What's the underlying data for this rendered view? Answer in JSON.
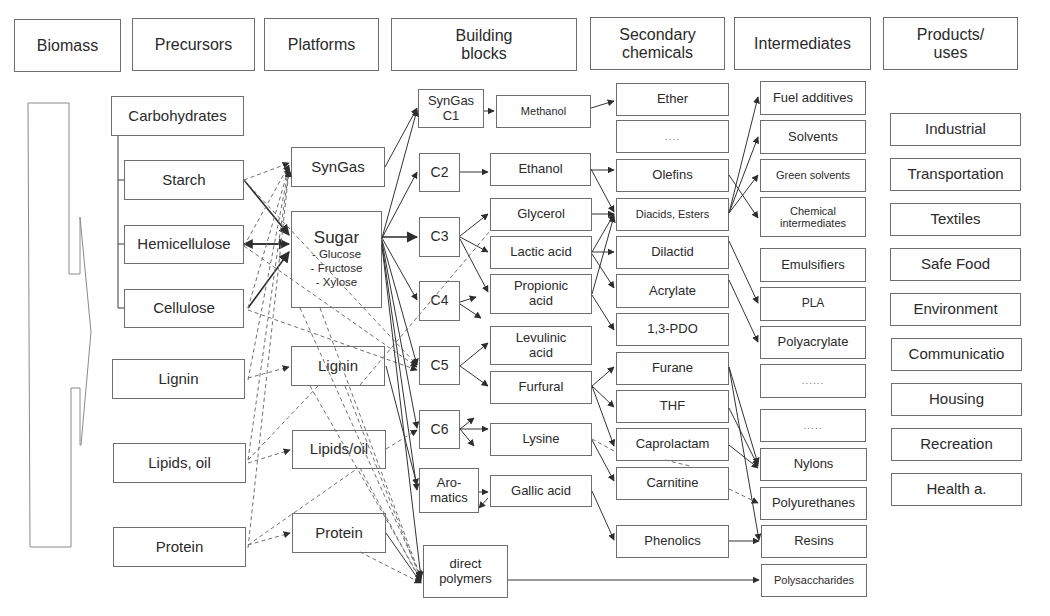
{
  "headers": {
    "biomass": "Biomass",
    "precursors": "Precursors",
    "platforms": "Platforms",
    "building_blocks": "Building\nblocks",
    "secondary_chemicals": "Secondary\nchemicals",
    "intermediates": "Intermediates",
    "products_uses": "Products/\nuses"
  },
  "precursors": {
    "carbohydrates": "Carbohydrates",
    "starch": "Starch",
    "hemicellulose": "Hemicellulose",
    "cellulose": "Cellulose",
    "lignin": "Lignin",
    "lipids_oil": "Lipids, oil",
    "protein": "Protein"
  },
  "platforms": {
    "syngas": "SynGas",
    "sugar": {
      "title": "Sugar",
      "items": [
        "- Glucose",
        "- Fructose",
        "- Xylose"
      ]
    },
    "lignin": "Lignin",
    "lipids_oil": "Lipids/oil",
    "protein": "Protein"
  },
  "building_blocks": {
    "syngas_c1": "SynGas\nC1",
    "c2": "C2",
    "c3": "C3",
    "c4": "C4",
    "c5": "C5",
    "c6": "C6",
    "aromatics": "Aro-\nmatics",
    "direct_polymers": "direct\npolymers"
  },
  "derived_building_blocks": {
    "methanol": "Methanol",
    "ethanol": "Ethanol",
    "glycerol": "Glycerol",
    "lactic_acid": "Lactic acid",
    "propionic_acid": "Propionic\nacid",
    "levulinic_acid": "Levulinic\nacid",
    "furfural": "Furfural",
    "lysine": "Lysine",
    "gallic_acid": "Gallic acid"
  },
  "secondary_chemicals": {
    "ether": "Ether",
    "ellipsis": "....",
    "olefins": "Olefins",
    "diacids_esters": "Diacids, Esters",
    "dilactid": "Dilactid",
    "acrylate": "Acrylate",
    "pdo": "1,3-PDO",
    "furane": "Furane",
    "thf": "THF",
    "caprolactam": "Caprolactam",
    "carnitine": "Carnitine",
    "phenolics": "Phenolics"
  },
  "intermediates": {
    "fuel_additives": "Fuel additives",
    "solvents": "Solvents",
    "green_solvents": "Green solvents",
    "chemical_intermediates": "Chemical\nintermediates",
    "emulsifiers": "Emulsifiers",
    "pla": "PLA",
    "polyacrylate": "Polyacrylate",
    "ellipsis_1": "......",
    "ellipsis_2": ".....",
    "nylons": "Nylons",
    "polyurethanes": "Polyurethanes",
    "resins": "Resins",
    "polysaccharides": "Polysaccharides"
  },
  "products_uses": {
    "industrial": "Industrial",
    "transportation": "Transportation",
    "textiles": "Textiles",
    "safe_food": "Safe Food",
    "environment": "Environment",
    "communication": "Communicatio",
    "housing": "Housing",
    "recreation": "Recreation",
    "health": "Health a."
  },
  "style": {
    "line_color": "#3a3a3a",
    "dashed_color": "#707070",
    "box_border": "#6e6e6e"
  }
}
